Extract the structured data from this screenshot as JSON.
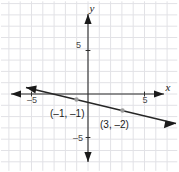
{
  "figure": {
    "width": 179,
    "height": 172,
    "background": "#ffffff"
  },
  "chart_data": {
    "type": "line",
    "title": "",
    "xlabel": "x",
    "ylabel": "y",
    "xlim": [
      -7.7,
      7.9
    ],
    "ylim": [
      -6.8,
      8.2
    ],
    "grid": true,
    "grid_spacing": 1,
    "grid_color": "#e2e2e6",
    "axis_color": "#2b2b2b",
    "legend": "none",
    "x_tick_labels": [
      {
        "value": -5,
        "text": "–5"
      },
      {
        "value": 5,
        "text": "5"
      }
    ],
    "y_tick_labels": [
      {
        "value": 5,
        "text": "5"
      },
      {
        "value": -5,
        "text": "–5"
      }
    ],
    "series": [
      {
        "name": "line",
        "color": "#262626",
        "slope": -0.25,
        "intercept": -1.25,
        "equation": "y = -0.25x - 1.25",
        "arrows": "both",
        "x": [
          -7.6,
          7.8
        ],
        "y": [
          0.65,
          -3.2
        ]
      }
    ],
    "points": [
      {
        "x": -1,
        "y": -1,
        "label": "(–1, –1)",
        "marker_color": "#9b9b9b",
        "label_dx": -26,
        "label_dy": 18
      },
      {
        "x": 3,
        "y": -2,
        "label": "(3, –2)",
        "marker_color": "#9b9b9b",
        "label_dx": -22,
        "label_dy": 18
      }
    ]
  },
  "labels": {
    "x_axis_name": "x",
    "y_axis_name": "y",
    "x_neg_tick": "–5",
    "x_pos_tick": "5",
    "y_pos_tick": "5",
    "y_neg_tick": "–5",
    "point_one": "(–1, –1)",
    "point_two": "(3, –2)"
  }
}
